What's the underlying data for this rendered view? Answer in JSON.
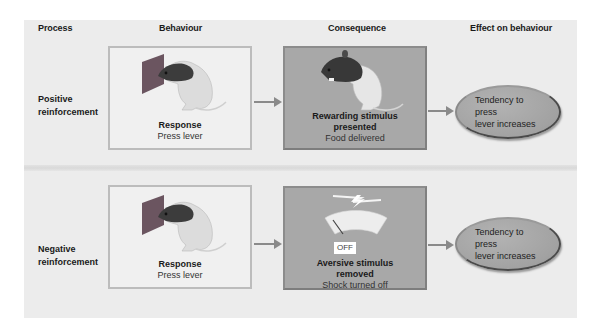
{
  "headers": {
    "process": "Process",
    "behaviour": "Behaviour",
    "consequence": "Consequence",
    "effect": "Effect on behaviour"
  },
  "rows": [
    {
      "process": [
        "Positive",
        "reinforcement"
      ],
      "behaviour": {
        "title": "Response",
        "sub": "Press lever",
        "icon": "rat-pressing-lever"
      },
      "consequence": {
        "title_lines": [
          "Rewarding stimulus",
          "presented"
        ],
        "sub": "Food delivered",
        "icon": "rat-eating"
      },
      "effect": [
        "Tendency to press",
        "lever increases"
      ]
    },
    {
      "process": [
        "Negative",
        "reinforcement"
      ],
      "behaviour": {
        "title": "Response",
        "sub": "Press lever",
        "icon": "rat-pressing-lever"
      },
      "consequence": {
        "title_lines": [
          "Aversive stimulus",
          "removed"
        ],
        "sub": "Shock turned off",
        "icon": "shock-meter-off",
        "badge": "OFF"
      },
      "effect": [
        "Tendency to press",
        "lever increases"
      ]
    }
  ],
  "colors": {
    "panel": "#ececec",
    "behaviour_box": "#f0f0f0",
    "consequence_box": "#a8a8a8",
    "ellipse": "#a6a6a6",
    "arrow": "#8a8a8a"
  }
}
